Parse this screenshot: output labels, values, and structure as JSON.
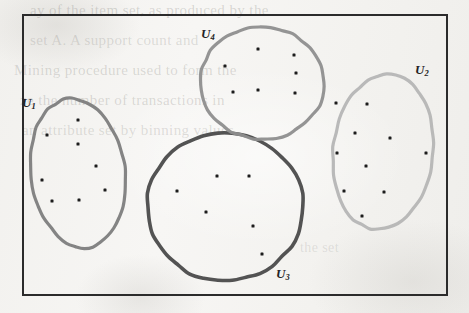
{
  "figure": {
    "caption": "",
    "background_color": "#f4f3f1",
    "frame": {
      "name": "universe-rectangle",
      "x": 23,
      "y": 15,
      "width": 424,
      "height": 280,
      "stroke_color": "#2b2b2b",
      "stroke_width": 2
    }
  },
  "ghost_text": [
    {
      "text": "ay of the item set, as produced by the",
      "x": 30,
      "y": 2,
      "size": 15,
      "opacity": 0.26
    },
    {
      "text": "set A. A support count and",
      "x": 30,
      "y": 32,
      "size": 15,
      "opacity": 0.22
    },
    {
      "text": "Mining procedure used to form the",
      "x": 14,
      "y": 62,
      "size": 15,
      "opacity": 0.24
    },
    {
      "text": "ze the number of transactions in",
      "x": 20,
      "y": 92,
      "size": 15,
      "opacity": 0.24
    },
    {
      "text": "an attribute set by binning values",
      "x": 22,
      "y": 122,
      "size": 15,
      "opacity": 0.22
    },
    {
      "text": "the set",
      "x": 300,
      "y": 240,
      "size": 14,
      "opacity": 0.18
    }
  ],
  "sets": [
    {
      "id": "U1",
      "label": "U",
      "subscript": "1",
      "label_x": 22,
      "label_y": 95,
      "shape": "ellipse",
      "cx": 78,
      "cy": 173,
      "rx": 47,
      "ry": 75,
      "rotation": -8,
      "stroke_color": "#7d7d7d",
      "stroke_width": 3.2,
      "point_count": 8,
      "points": [
        {
          "x": 78,
          "y": 120
        },
        {
          "x": 47,
          "y": 135
        },
        {
          "x": 78,
          "y": 144
        },
        {
          "x": 96,
          "y": 166
        },
        {
          "x": 42,
          "y": 180
        },
        {
          "x": 105,
          "y": 190
        },
        {
          "x": 52,
          "y": 201
        },
        {
          "x": 79,
          "y": 200
        }
      ]
    },
    {
      "id": "U2",
      "label": "U",
      "subscript": "2",
      "label_x": 415,
      "label_y": 62,
      "shape": "ellipse",
      "cx": 383,
      "cy": 152,
      "rx": 50,
      "ry": 78,
      "rotation": 6,
      "stroke_color": "#b5b5b5",
      "stroke_width": 3.2,
      "point_count": 10,
      "points": [
        {
          "x": 336,
          "y": 103
        },
        {
          "x": 367,
          "y": 104
        },
        {
          "x": 355,
          "y": 133
        },
        {
          "x": 390,
          "y": 138
        },
        {
          "x": 337,
          "y": 153
        },
        {
          "x": 426,
          "y": 153
        },
        {
          "x": 366,
          "y": 166
        },
        {
          "x": 344,
          "y": 191
        },
        {
          "x": 384,
          "y": 192
        },
        {
          "x": 362,
          "y": 216
        }
      ]
    },
    {
      "id": "U3",
      "label": "U",
      "subscript": "3",
      "label_x": 276,
      "label_y": 266,
      "shape": "circle",
      "cx": 225,
      "cy": 207,
      "rx": 78,
      "ry": 74,
      "rotation": 0,
      "stroke_color": "#4a4a4a",
      "stroke_width": 3.6,
      "point_count": 6,
      "points": [
        {
          "x": 217,
          "y": 176
        },
        {
          "x": 249,
          "y": 176
        },
        {
          "x": 177,
          "y": 191
        },
        {
          "x": 206,
          "y": 212
        },
        {
          "x": 253,
          "y": 226
        },
        {
          "x": 262,
          "y": 254
        }
      ]
    },
    {
      "id": "U4",
      "label": "U",
      "subscript": "4",
      "label_x": 201,
      "label_y": 26,
      "shape": "ellipse",
      "cx": 262,
      "cy": 83,
      "rx": 62,
      "ry": 56,
      "rotation": 3,
      "stroke_color": "#8e8e8e",
      "stroke_width": 3.2,
      "point_count": 7,
      "points": [
        {
          "x": 258,
          "y": 49
        },
        {
          "x": 294,
          "y": 55
        },
        {
          "x": 225,
          "y": 66
        },
        {
          "x": 296,
          "y": 73
        },
        {
          "x": 233,
          "y": 92
        },
        {
          "x": 258,
          "y": 90
        },
        {
          "x": 295,
          "y": 93
        }
      ]
    }
  ],
  "point_style": {
    "color": "#1c1c1c",
    "size": 3.0,
    "shape": "square-dot"
  },
  "totals": {
    "set_count": 4,
    "point_total": 31
  }
}
